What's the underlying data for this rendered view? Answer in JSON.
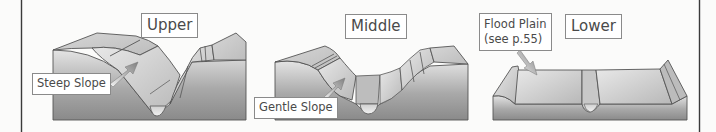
{
  "figure": {
    "topic": "River valley cross-sections by course",
    "sections": [
      {
        "id": "upper",
        "title": "Upper",
        "callout": "Steep Slope",
        "valley_shape": "V-shaped"
      },
      {
        "id": "middle",
        "title": "Middle",
        "callout": "Gentle Slope",
        "valley_shape": "wide shallow valley"
      },
      {
        "id": "lower",
        "title": "Lower",
        "callout_line1": "Flood Plain",
        "callout_line2": "(see p.55)",
        "valley_shape": "flat floodplain"
      }
    ]
  },
  "colors": {
    "background": "#fbfbfa",
    "border_line": "#3a3a3a",
    "label_border": "#8a8a8a",
    "label_text": "#4a4a4a",
    "block_dark": "#8c8c8c",
    "block_light": "#d8d8d8",
    "top_face": "#c4c4c4",
    "arrow": "#8f8f8f"
  }
}
